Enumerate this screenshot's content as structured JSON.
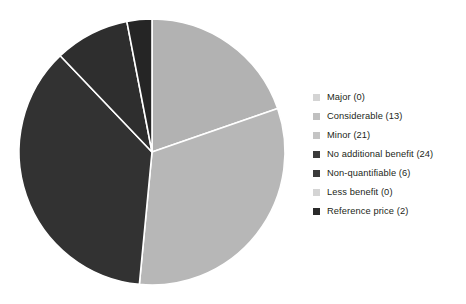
{
  "chart_data": {
    "type": "pie",
    "title": "",
    "subtitle": "",
    "xlabel": "",
    "ylabel": "",
    "grid": false,
    "legend_position": "right",
    "total": 66,
    "start_angle_deg": 0,
    "direction": "clockwise",
    "categories": [
      "Major (0)",
      "Considerable (13)",
      "Minor (21)",
      "No additional benefit (24)",
      "Non-quantifiable (6)",
      "Less benefit (0)",
      "Reference price (2)"
    ],
    "values": [
      0,
      13,
      21,
      24,
      6,
      0,
      2
    ],
    "slices": [
      {
        "label": "Major",
        "count": 0,
        "legend_text": "Major (0)",
        "color": "#d4d4d4",
        "percent": "0.0",
        "angle_deg": 0
      },
      {
        "label": "Considerable",
        "count": 13,
        "legend_text": "Considerable (13)",
        "color": "#b2b2b2",
        "percent": "19.7",
        "angle_deg": 70.9
      },
      {
        "label": "Minor",
        "count": 21,
        "legend_text": "Minor (21)",
        "color": "#b7b7b7",
        "percent": "31.8",
        "angle_deg": 114.5
      },
      {
        "label": "No additional benefit",
        "count": 24,
        "legend_text": "No additional benefit (24)",
        "color": "#323232",
        "percent": "36.4",
        "angle_deg": 130.9
      },
      {
        "label": "Non-quantifiable",
        "count": 6,
        "legend_text": "Non-quantifiable (6)",
        "color": "#2e2e2e",
        "percent": "9.1",
        "angle_deg": 32.7
      },
      {
        "label": "Less benefit",
        "count": 0,
        "legend_text": "Less benefit (0)",
        "color": "#d4d4d4",
        "percent": "0.0",
        "angle_deg": 0
      },
      {
        "label": "Reference price",
        "count": 2,
        "legend_text": "Reference price (2)",
        "color": "#252525",
        "percent": "3.0",
        "angle_deg": 10.9
      }
    ],
    "geometry": {
      "center_x": 152,
      "center_y": 152,
      "radius": 133,
      "separator_color": "#ffffff",
      "separator_width": 1.6
    },
    "colors": {
      "background": "#ffffff",
      "text": "#231f20",
      "light_gray": "#b2b2b2",
      "dark_gray": "#323232"
    }
  },
  "legend": {
    "items": [
      {
        "text": "Major (0)",
        "swatch": "#d4d4d4"
      },
      {
        "text": "Considerable (13)",
        "swatch": "#c0c0c0"
      },
      {
        "text": "Minor (21)",
        "swatch": "#c4c4c4"
      },
      {
        "text": "No additional benefit (24)",
        "swatch": "#3a3a3a"
      },
      {
        "text": "Non-quantifiable (6)",
        "swatch": "#3a3a3a"
      },
      {
        "text": "Less benefit (0)",
        "swatch": "#d4d4d4"
      },
      {
        "text": "Reference price (2)",
        "swatch": "#2a2a2a"
      }
    ]
  }
}
